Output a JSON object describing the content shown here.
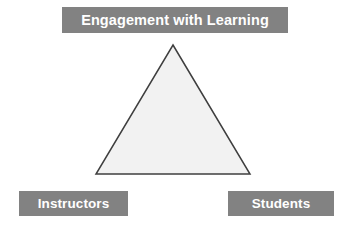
{
  "diagram": {
    "type": "triangle-relationship",
    "background_color": "#ffffff",
    "labels": {
      "apex": {
        "text": "Engagement with Learning",
        "box_color": "#828282",
        "text_color": "#ffffff",
        "position": "top"
      },
      "bottom_left": {
        "text": "Instructors",
        "box_color": "#828282",
        "text_color": "#ffffff",
        "position": "bottom-left"
      },
      "bottom_right": {
        "text": "Students",
        "box_color": "#828282",
        "text_color": "#ffffff",
        "position": "bottom-right"
      }
    },
    "shape": {
      "name": "triangle",
      "fill_color": "#f2f2f2",
      "stroke_color": "#3f3f3f",
      "stroke_width": 1.5,
      "apex_point": "173,45",
      "bottom_left_point": "96,174",
      "bottom_right_point": "250,174"
    }
  }
}
